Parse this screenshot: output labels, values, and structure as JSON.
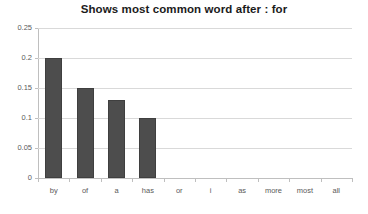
{
  "chart_data": {
    "type": "bar",
    "title": "Shows most common word after : for",
    "xlabel": "",
    "ylabel": "",
    "categories": [
      "by",
      "of",
      "a",
      "has",
      "or",
      "i",
      "as",
      "more",
      "most",
      "all"
    ],
    "values": [
      0.2,
      0.15,
      0.13,
      0.1,
      0,
      0,
      0,
      0,
      0,
      0
    ],
    "ylim": [
      0,
      0.25
    ],
    "ytick_labels": [
      "0",
      "0.05",
      "0.1",
      "0.15",
      "0.2",
      "0.25"
    ],
    "ytick_values": [
      0,
      0.05,
      0.1,
      0.15,
      0.2,
      0.25
    ],
    "grid": true,
    "legend": false,
    "series": [
      {
        "name": "frequency",
        "values": [
          0.2,
          0.15,
          0.13,
          0.1,
          0,
          0,
          0,
          0,
          0,
          0
        ]
      }
    ],
    "colors": {
      "bar_fill": "#4d4d4d",
      "bar_stroke": "#3f3f3f",
      "gridline": "#d9d9d9",
      "axis": "#bfbfbf",
      "title_text": "#1b1b1b",
      "tick_text": "#5a5a5a",
      "background": "#ffffff"
    }
  }
}
